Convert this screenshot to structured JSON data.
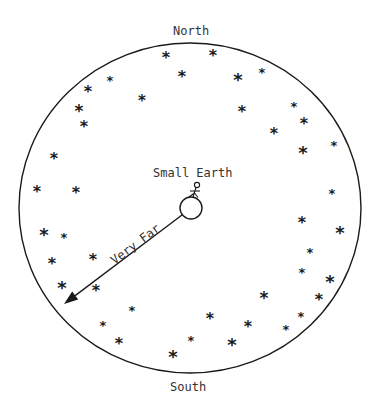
{
  "diagram": {
    "title_top": "North",
    "title_bottom": "South",
    "center_label": "Small Earth",
    "arrow_label": "Very Far",
    "sky_ellipse": {
      "cx": 190,
      "cy": 208,
      "rx": 171,
      "ry": 165
    },
    "earth": {
      "cx": 191,
      "cy": 208,
      "r": 11
    },
    "arrow": {
      "x1": 182,
      "y1": 215,
      "x2": 64,
      "y2": 304
    },
    "colors": {
      "ink": "#1a1a1a",
      "text": "#333333",
      "background": "#ffffff"
    },
    "stars": [
      {
        "x": 166,
        "y": 56,
        "s": 13
      },
      {
        "x": 213,
        "y": 54,
        "s": 13
      },
      {
        "x": 182,
        "y": 75,
        "s": 13
      },
      {
        "x": 238,
        "y": 78,
        "s": 15
      },
      {
        "x": 262,
        "y": 70,
        "s": 10
      },
      {
        "x": 110,
        "y": 78,
        "s": 10
      },
      {
        "x": 88,
        "y": 90,
        "s": 13
      },
      {
        "x": 142,
        "y": 99,
        "s": 12
      },
      {
        "x": 79,
        "y": 109,
        "s": 14
      },
      {
        "x": 242,
        "y": 110,
        "s": 13
      },
      {
        "x": 294,
        "y": 104,
        "s": 10
      },
      {
        "x": 304,
        "y": 122,
        "s": 13
      },
      {
        "x": 84,
        "y": 125,
        "s": 13
      },
      {
        "x": 274,
        "y": 132,
        "s": 13
      },
      {
        "x": 303,
        "y": 151,
        "s": 15
      },
      {
        "x": 334,
        "y": 143,
        "s": 10
      },
      {
        "x": 54,
        "y": 157,
        "s": 13
      },
      {
        "x": 37,
        "y": 190,
        "s": 13
      },
      {
        "x": 76,
        "y": 191,
        "s": 13
      },
      {
        "x": 332,
        "y": 191,
        "s": 10
      },
      {
        "x": 302,
        "y": 221,
        "s": 13
      },
      {
        "x": 340,
        "y": 231,
        "s": 15
      },
      {
        "x": 44,
        "y": 233,
        "s": 15
      },
      {
        "x": 64,
        "y": 235,
        "s": 10
      },
      {
        "x": 310,
        "y": 250,
        "s": 10
      },
      {
        "x": 52,
        "y": 262,
        "s": 13
      },
      {
        "x": 93,
        "y": 258,
        "s": 13
      },
      {
        "x": 302,
        "y": 270,
        "s": 10
      },
      {
        "x": 330,
        "y": 280,
        "s": 15
      },
      {
        "x": 62,
        "y": 286,
        "s": 15
      },
      {
        "x": 96,
        "y": 289,
        "s": 13
      },
      {
        "x": 264,
        "y": 296,
        "s": 14
      },
      {
        "x": 319,
        "y": 298,
        "s": 13
      },
      {
        "x": 132,
        "y": 308,
        "s": 10
      },
      {
        "x": 301,
        "y": 314,
        "s": 10
      },
      {
        "x": 210,
        "y": 317,
        "s": 13
      },
      {
        "x": 103,
        "y": 323,
        "s": 10
      },
      {
        "x": 248,
        "y": 325,
        "s": 13
      },
      {
        "x": 286,
        "y": 327,
        "s": 10
      },
      {
        "x": 191,
        "y": 338,
        "s": 10
      },
      {
        "x": 119,
        "y": 342,
        "s": 13
      },
      {
        "x": 232,
        "y": 343,
        "s": 15
      },
      {
        "x": 173,
        "y": 355,
        "s": 15
      }
    ]
  }
}
